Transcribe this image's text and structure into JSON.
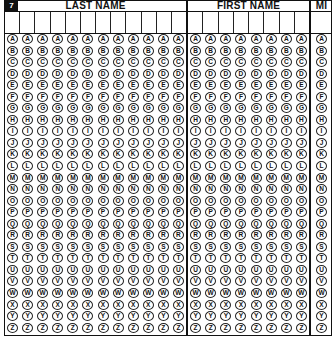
{
  "form": {
    "number": "7",
    "sections": [
      {
        "id": "last",
        "title": "LAST NAME",
        "columns": 12
      },
      {
        "id": "first",
        "title": "FIRST NAME",
        "columns": 8
      },
      {
        "id": "mi",
        "title": "MI",
        "columns": 1
      }
    ],
    "letters": [
      "A",
      "B",
      "C",
      "D",
      "E",
      "F",
      "G",
      "H",
      "I",
      "J",
      "K",
      "L",
      "M",
      "N",
      "O",
      "P",
      "Q",
      "R",
      "S",
      "T",
      "U",
      "V",
      "W",
      "X",
      "Y",
      "Z"
    ],
    "colors": {
      "ink": "#111111",
      "paper": "#ffffff"
    }
  }
}
